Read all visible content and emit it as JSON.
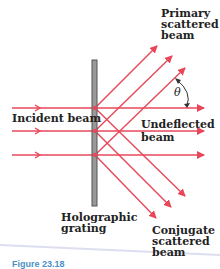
{
  "labels": {
    "primary": [
      "Primary",
      "scattered",
      "beam"
    ],
    "incident": "Incident beam",
    "undeflected": [
      "Undeflected",
      "beam"
    ],
    "grating": [
      "Holographic",
      "grating"
    ],
    "conjugate": [
      "Conjugate",
      "scattered",
      "beam"
    ],
    "theta": "θ"
  },
  "caption": "Figure 23.18",
  "colors": {
    "beam": "#e8475a",
    "grating": "#888888",
    "text": "#222222"
  }
}
